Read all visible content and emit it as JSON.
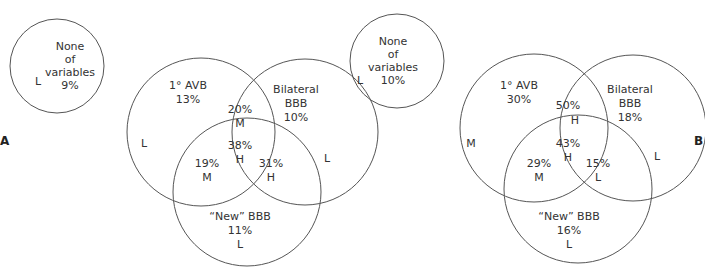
{
  "panels": [
    {
      "id": "A",
      "label": "A",
      "none": {
        "line1": "None",
        "line2": "of",
        "line3": "variables",
        "pct": "9%",
        "level": "L"
      },
      "avb": {
        "name": "1° AVB",
        "pct": "13%",
        "level": "L"
      },
      "bilateral": {
        "name1": "Bilateral",
        "name2": "BBB",
        "pct": "10%",
        "level": "L"
      },
      "newbbb": {
        "name": "“New” BBB",
        "pct": "11%",
        "level": "L"
      },
      "avb_bilateral": {
        "pct": "20%",
        "level": "M"
      },
      "all_three": {
        "pct": "38%",
        "level": "H"
      },
      "avb_new": {
        "pct": "19%",
        "level": "M"
      },
      "bilateral_new": {
        "pct": "31%",
        "level": "H"
      }
    },
    {
      "id": "B",
      "label": "B",
      "none": {
        "line1": "None",
        "line2": "of",
        "line3": "variables",
        "pct": "10%",
        "level": "L"
      },
      "avb": {
        "name": "1° AVB",
        "pct": "30%",
        "level": "M"
      },
      "bilateral": {
        "name1": "Bilateral",
        "name2": "BBB",
        "pct": "18%",
        "level": "L"
      },
      "newbbb": {
        "name": "“New” BBB",
        "pct": "16%",
        "level": "L"
      },
      "avb_bilateral": {
        "pct": "50%",
        "level": "H"
      },
      "all_three": {
        "pct": "43%",
        "level": "H"
      },
      "avb_new": {
        "pct": "29%",
        "level": "M"
      },
      "bilateral_new": {
        "pct": "15%",
        "level": "L"
      }
    }
  ]
}
